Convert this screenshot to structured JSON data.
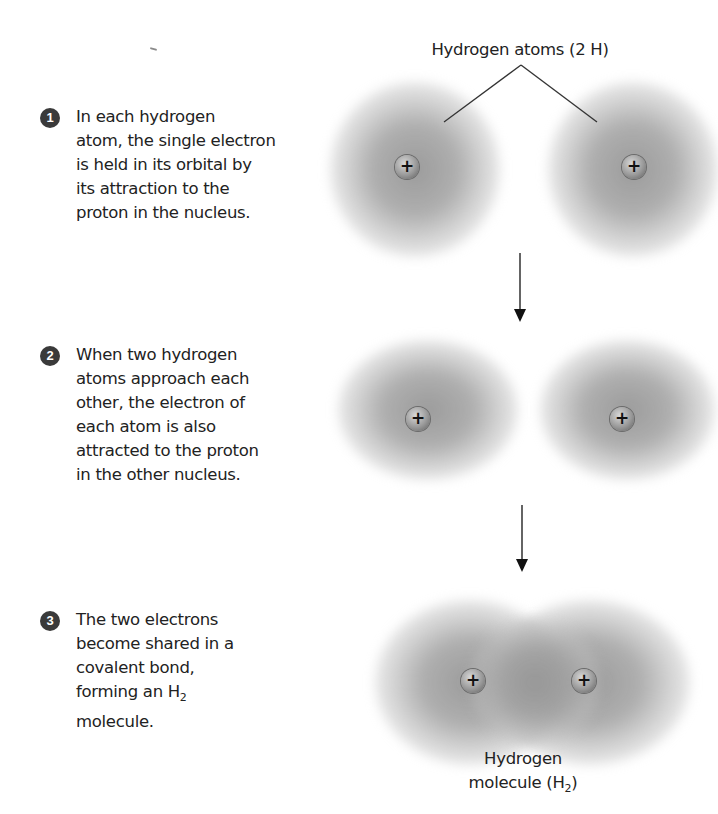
{
  "figure": {
    "top_label": "Hydrogen atoms (2 H)",
    "bottom_label": {
      "line1": "Hydrogen",
      "line2_prefix": "molecule (H",
      "line2_sub": "2",
      "line2_suffix": ")"
    },
    "proton_symbol": "+",
    "colors": {
      "text": "#222222",
      "badge": "#3a3a3a",
      "cloud": "#a0a0a0",
      "proton": "#9a9a9a",
      "lines": "#333333"
    }
  },
  "steps": [
    {
      "number": "1",
      "lines": [
        "In each hydrogen",
        "atom, the single electron",
        "is held in its orbital by",
        "its attraction to the",
        "proton in the nucleus."
      ]
    },
    {
      "number": "2",
      "lines": [
        "When two hydrogen",
        "atoms approach each",
        "other, the electron of",
        "each atom is also",
        "attracted to the proton",
        "in the other nucleus."
      ]
    },
    {
      "number": "3",
      "lines": [
        "The two electrons",
        "become shared in a",
        "covalent bond,"
      ],
      "line4_prefix": "forming an H",
      "line4_sub": "2",
      "line5": "molecule."
    }
  ]
}
